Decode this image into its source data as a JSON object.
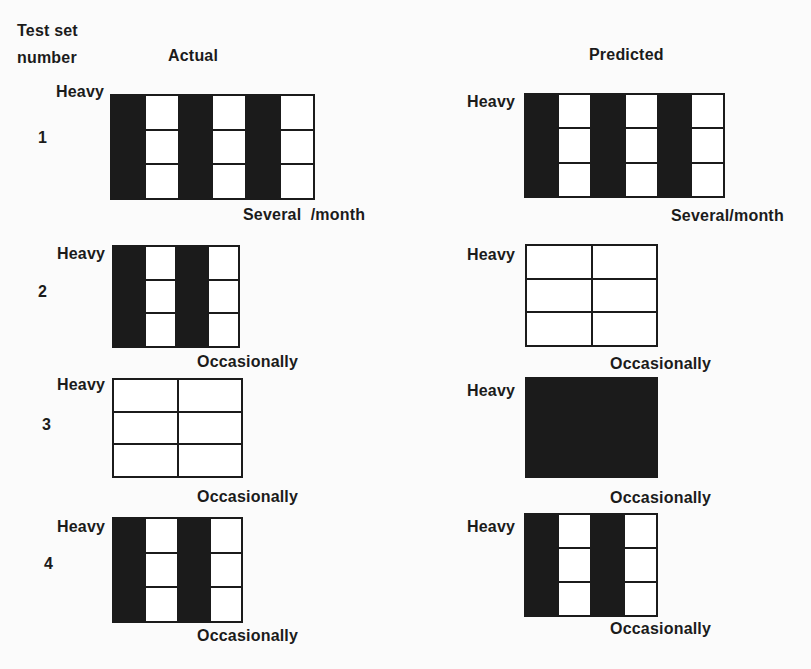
{
  "colors": {
    "ink": "#1b1b1b",
    "paper": "#fbfbfb"
  },
  "header": {
    "test_set_line1": "Test set",
    "test_set_line2": "number",
    "actual": "Actual",
    "predicted": "Predicted"
  },
  "test_sets": [
    {
      "number": "1",
      "actual": {
        "top_label": "Heavy",
        "bottom_label": "Several  /month",
        "solid": false,
        "rows": 3,
        "pattern": [
          "black",
          "white",
          "black",
          "white",
          "black",
          "white"
        ]
      },
      "predicted": {
        "top_label": "Heavy",
        "bottom_label": "Several/month",
        "solid": false,
        "rows": 3,
        "pattern": [
          "black",
          "white",
          "black",
          "white",
          "black",
          "white"
        ]
      }
    },
    {
      "number": "2",
      "actual": {
        "top_label": "Heavy",
        "bottom_label": "Occasionally",
        "solid": false,
        "rows": 3,
        "pattern": [
          "black",
          "white",
          "black",
          "white"
        ]
      },
      "predicted": {
        "top_label": "Heavy",
        "bottom_label": "Occasionally",
        "solid": false,
        "rows": 3,
        "pattern": [
          "white",
          "white"
        ]
      }
    },
    {
      "number": "3",
      "actual": {
        "top_label": "Heavy",
        "bottom_label": "Occasionally",
        "solid": false,
        "rows": 3,
        "pattern": [
          "white",
          "white"
        ]
      },
      "predicted": {
        "top_label": "Heavy",
        "bottom_label": "Occasionally",
        "solid": true,
        "rows": 3,
        "pattern": []
      }
    },
    {
      "number": "4",
      "actual": {
        "top_label": "Heavy",
        "bottom_label": "Occasionally",
        "solid": false,
        "rows": 3,
        "pattern": [
          "black",
          "white",
          "black",
          "white"
        ]
      },
      "predicted": {
        "top_label": "Heavy",
        "bottom_label": "Occasionally",
        "solid": false,
        "rows": 3,
        "pattern": [
          "black",
          "white",
          "black",
          "white"
        ]
      }
    }
  ]
}
